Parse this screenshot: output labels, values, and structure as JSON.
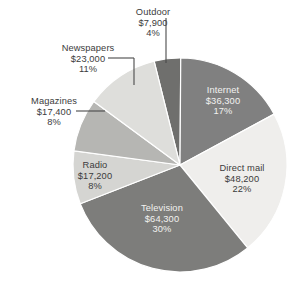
{
  "chart_data": {
    "type": "pie",
    "title": "",
    "subtitle": "",
    "xlabel": "",
    "ylabel": "",
    "legend_position": "none",
    "grid": false,
    "value_prefix": "$",
    "total_label": "",
    "categories": [
      "Outdoor",
      "Internet",
      "Direct mail",
      "Television",
      "Radio",
      "Magazines",
      "Newspapers"
    ],
    "values": [
      7900,
      36300,
      48200,
      64300,
      17200,
      17400,
      23000
    ],
    "percents": [
      4,
      17,
      22,
      30,
      8,
      8,
      11
    ],
    "slices": [
      {
        "name": "Outdoor",
        "value": 7900,
        "value_text": "$7,900",
        "percent": 4,
        "percent_text": "4%",
        "color": "#6f6f6d",
        "label_placement": "external",
        "leader_line": true,
        "text_color": "#3b3b3b"
      },
      {
        "name": "Internet",
        "value": 36300,
        "value_text": "$36,300",
        "percent": 17,
        "percent_text": "17%",
        "color": "#808080",
        "label_placement": "internal",
        "leader_line": false,
        "text_color": "#f2f2f0"
      },
      {
        "name": "Direct mail",
        "value": 48200,
        "value_text": "$48,200",
        "percent": 22,
        "percent_text": "22%",
        "color": "#efeeec",
        "label_placement": "internal",
        "leader_line": false,
        "text_color": "#3b3b3b"
      },
      {
        "name": "Television",
        "value": 64300,
        "value_text": "$64,300",
        "percent": 30,
        "percent_text": "30%",
        "color": "#7d7d7b",
        "label_placement": "internal",
        "leader_line": false,
        "text_color": "#d8d8d4"
      },
      {
        "name": "Radio",
        "value": 17200,
        "value_text": "$17,200",
        "percent": 8,
        "percent_text": "8%",
        "color": "#d5d5d2",
        "label_placement": "internal",
        "leader_line": false,
        "text_color": "#3b3b3b"
      },
      {
        "name": "Magazines",
        "value": 17400,
        "value_text": "$17,400",
        "percent": 8,
        "percent_text": "8%",
        "color": "#b6b6b3",
        "label_placement": "external",
        "leader_line": true,
        "text_color": "#3b3b3b"
      },
      {
        "name": "Newspapers",
        "value": 23000,
        "value_text": "$23,000",
        "percent": 11,
        "percent_text": "11%",
        "color": "#dededb",
        "label_placement": "external",
        "leader_line": true,
        "text_color": "#3b3b3b"
      }
    ],
    "geometry": {
      "center_x": 180,
      "center_y": 165,
      "radius": 107,
      "start_angle_deg": -14
    }
  },
  "labels": {
    "outdoor": {
      "name": "Outdoor",
      "value": "$7,900",
      "percent": "4%"
    },
    "newspapers": {
      "name": "Newspapers",
      "value": "$23,000",
      "percent": "11%"
    },
    "magazines": {
      "name": "Magazines",
      "value": "$17,400",
      "percent": "8%"
    },
    "radio": {
      "name": "Radio",
      "value": "$17,200",
      "percent": "8%"
    },
    "television": {
      "name": "Television",
      "value": "$64,300",
      "percent": "30%"
    },
    "directmail": {
      "name": "Direct mail",
      "value": "$48,200",
      "percent": "22%"
    },
    "internet": {
      "name": "Internet",
      "value": "$36,300",
      "percent": "17%"
    }
  }
}
